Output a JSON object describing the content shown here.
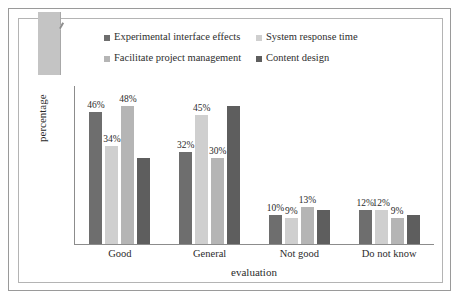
{
  "chart_data": {
    "type": "bar",
    "title": "",
    "xlabel": "evaluation",
    "ylabel": "percentage",
    "categories": [
      "Good",
      "General",
      "Not good",
      "Do not know"
    ],
    "ylim": [
      0,
      55
    ],
    "grid": false,
    "legend_position": "top",
    "value_suffix": "%",
    "series": [
      {
        "name": "Experimental interface effects",
        "color": "#6e6e6e",
        "values": [
          46,
          32,
          10,
          12
        ],
        "labels": [
          "46%",
          "32%",
          "10%",
          "12%"
        ]
      },
      {
        "name": "System response time",
        "color": "#cfcfcf",
        "values": [
          34,
          45,
          9,
          12
        ],
        "labels": [
          "34%",
          "45%",
          "9%",
          "12%"
        ]
      },
      {
        "name": "Facilitate project management",
        "color": "#b5b5b5",
        "values": [
          48,
          30,
          13,
          9
        ],
        "labels": [
          "48%",
          "30%",
          "13%",
          "9%"
        ]
      },
      {
        "name": "Content design",
        "color": "#5e5e5e",
        "values": [
          30,
          48,
          12,
          10
        ],
        "labels": [
          "",
          "",
          "",
          ""
        ]
      }
    ]
  },
  "legend": {
    "items": [
      {
        "label": "Experimental interface effects",
        "color": "#6e6e6e"
      },
      {
        "label": "System response time",
        "color": "#cfcfcf"
      },
      {
        "label": "Facilitate project management",
        "color": "#b5b5b5"
      },
      {
        "label": "Content design",
        "color": "#5e5e5e"
      }
    ]
  },
  "axes": {
    "x_title": "evaluation",
    "y_title": "percentage"
  }
}
